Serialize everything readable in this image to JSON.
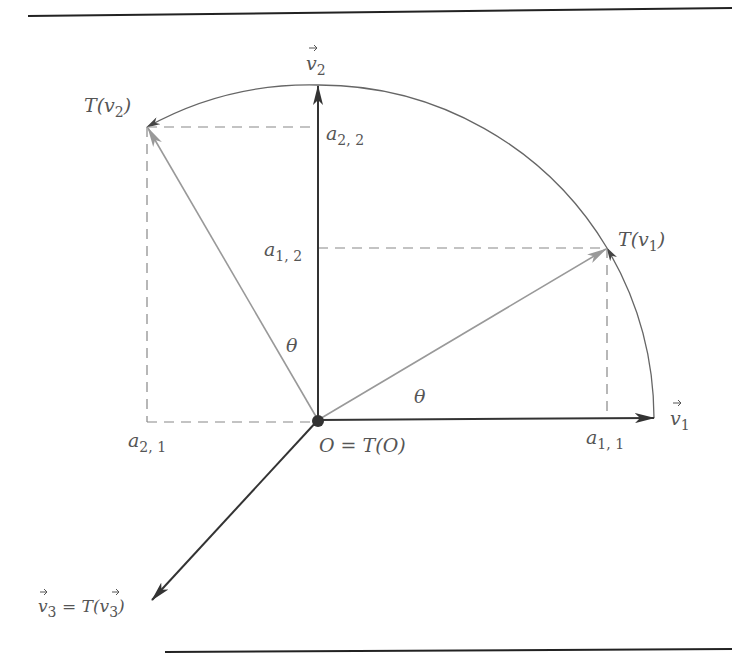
{
  "figure": {
    "labels": {
      "v2": "v",
      "v2_sub": "2",
      "v1": "v",
      "v1_sub": "1",
      "T_v2": "T(v",
      "T_v2_sub": "2",
      "T_v2_close": ")",
      "T_v1": "T(v",
      "T_v1_sub": "1",
      "T_v1_close": ")",
      "a22": "a",
      "a22_sub": "2, 2",
      "a12": "a",
      "a12_sub": "1, 2",
      "a21": "a",
      "a21_sub": "2, 1",
      "a11": "a",
      "a11_sub": "1, 1",
      "theta_left": "θ",
      "theta_right": "θ",
      "origin": "O = T(O)",
      "v3_lhs": "v",
      "v3_lhs_sub": "3",
      "v3_eq": " = T(",
      "v3_rhs": "v",
      "v3_rhs_sub": "3",
      "v3_close": ")"
    },
    "colors": {
      "axis": "#333333",
      "rotated": "#8a8a8a",
      "dashed": "#777777",
      "arc": "#666666",
      "rule": "#222222"
    }
  }
}
